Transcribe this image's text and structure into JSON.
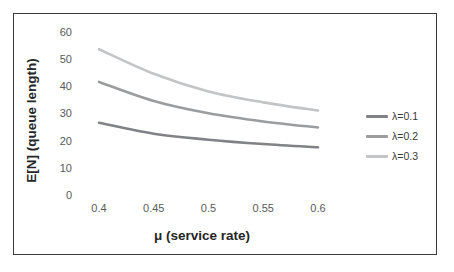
{
  "chart_data": {
    "type": "line",
    "title": "",
    "xlabel": "μ (service rate)",
    "ylabel": "E[N] (queue length)",
    "x": [
      0.4,
      0.45,
      0.5,
      0.55,
      0.6
    ],
    "xtick_labels": [
      "0.4",
      "0.45",
      "0.5",
      "0.55",
      "0.6"
    ],
    "ytick_labels": [
      "0",
      "10",
      "20",
      "30",
      "40",
      "50",
      "60"
    ],
    "ytick_values": [
      0,
      10,
      20,
      30,
      40,
      50,
      60
    ],
    "xlim": [
      0.375,
      0.625
    ],
    "ylim": [
      0,
      60
    ],
    "grid": false,
    "legend_position": "right",
    "series": [
      {
        "name": "λ=0.1",
        "color": "#808285",
        "values": [
          26.5,
          22.5,
          20.3,
          18.7,
          17.5
        ]
      },
      {
        "name": "λ=0.2",
        "color": "#9a9c9e",
        "values": [
          41.5,
          34.5,
          30.0,
          27.0,
          24.8
        ]
      },
      {
        "name": "λ=0.3",
        "color": "#c2c4c6",
        "values": [
          53.5,
          44.5,
          38.0,
          34.0,
          31.0
        ]
      }
    ]
  },
  "figure": {
    "border_color": "#3b3b3b",
    "background": "#ffffff",
    "tick_text_color": "#5a5a5a",
    "axis_title_color": "#262626"
  }
}
